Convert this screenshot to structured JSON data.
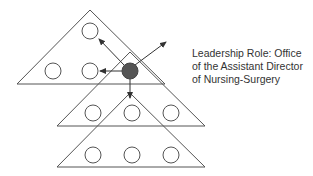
{
  "diagram": {
    "label_lines": [
      "Leadership Role: Office",
      "of the Assistant Director",
      "of Nursing-Surgery"
    ],
    "colors": {
      "stroke": "#555555",
      "leader_fill": "#555555",
      "node_fill": "#ffffff",
      "text": "#333333"
    },
    "layers": [
      {
        "name": "top-layer",
        "nodes": 3,
        "has_leader": true
      },
      {
        "name": "middle-layer",
        "nodes": 3
      },
      {
        "name": "bottom-layer",
        "nodes": 3
      }
    ],
    "arrows": [
      "up-left",
      "left",
      "down",
      "up-right"
    ]
  }
}
